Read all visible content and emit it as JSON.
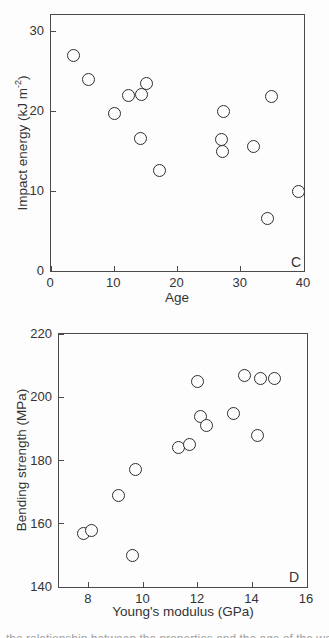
{
  "figure": {
    "background": "#fdfdfd",
    "ink_color": "#333333",
    "line_color": "#4a4a4a",
    "marker_style": "open-circle"
  },
  "chart_data": [
    {
      "type": "scatter",
      "panel_label": "C",
      "xlabel": "Age",
      "ylabel": "Impact energy (kJ m-2)",
      "ylabel_pre": "Impact energy (kJ m",
      "ylabel_sup": "-2",
      "ylabel_post": ")",
      "xlim": [
        0,
        40
      ],
      "ylim": [
        0,
        32
      ],
      "xticks": [
        0,
        10,
        20,
        30,
        40
      ],
      "yticks": [
        0,
        10,
        20,
        30
      ],
      "grid": false,
      "legend": null,
      "points": [
        [
          3.6,
          27.0
        ],
        [
          6.0,
          24.0
        ],
        [
          10.1,
          19.7
        ],
        [
          12.2,
          21.9
        ],
        [
          14.3,
          22.1
        ],
        [
          15.1,
          23.5
        ],
        [
          14.1,
          16.6
        ],
        [
          17.1,
          12.6
        ],
        [
          27.3,
          19.9
        ],
        [
          27.0,
          16.4
        ],
        [
          27.1,
          14.9
        ],
        [
          32.0,
          15.6
        ],
        [
          34.9,
          21.8
        ],
        [
          34.2,
          6.6
        ],
        [
          39.1,
          10.0
        ]
      ]
    },
    {
      "type": "scatter",
      "panel_label": "D",
      "xlabel": "Young's modulus (GPa)",
      "ylabel": "Bending strength (MPa)",
      "xlim": [
        6.9,
        16
      ],
      "ylim": [
        140,
        220
      ],
      "xticks": [
        8,
        10,
        12,
        14,
        16
      ],
      "yticks": [
        140,
        160,
        180,
        200,
        220
      ],
      "grid": false,
      "legend": null,
      "points": [
        [
          7.8,
          157
        ],
        [
          8.1,
          158
        ],
        [
          9.1,
          169
        ],
        [
          9.7,
          177
        ],
        [
          9.6,
          150
        ],
        [
          11.3,
          184
        ],
        [
          11.7,
          185
        ],
        [
          12.0,
          205
        ],
        [
          12.1,
          194
        ],
        [
          12.3,
          191
        ],
        [
          13.3,
          195
        ],
        [
          13.7,
          207
        ],
        [
          14.3,
          206
        ],
        [
          14.8,
          206
        ],
        [
          14.2,
          188
        ]
      ]
    }
  ],
  "caption": {
    "note": "cropped caption line, only letter tops visible (illegible)",
    "approx_text": "the relationship between the properties and the age of the wood"
  }
}
